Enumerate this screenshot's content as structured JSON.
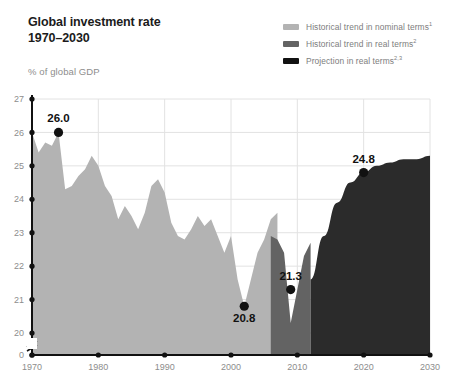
{
  "header": {
    "title_line1": "Global investment rate",
    "title_line2": "1970–2030",
    "subtitle": "% of global GDP"
  },
  "legend": {
    "position": "top-right",
    "items": [
      {
        "label": "Historical trend in nominal terms",
        "sup": "1",
        "color": "#b3b3b3",
        "swatch_name": "legend-swatch-nominal"
      },
      {
        "label": "Historical trend in real terms",
        "sup": "2",
        "color": "#636363",
        "swatch_name": "legend-swatch-real"
      },
      {
        "label": "Projection in real terms",
        "sup": "2,3",
        "color": "#111111",
        "swatch_name": "legend-swatch-projection"
      }
    ]
  },
  "colors": {
    "nominal": "#b3b3b3",
    "real": "#636363",
    "projection": "#2b2b2b",
    "axis": "#111111",
    "grid": "#e2e2e2",
    "tick_text": "#8d8d8d",
    "label_text": "#111111"
  },
  "chart_data": {
    "type": "area",
    "title": "Global investment rate 1970–2030",
    "subtitle": "% of global GDP",
    "xlabel": "",
    "ylabel": "% of global GDP",
    "xlim": [
      1970,
      2030
    ],
    "ylim": [
      20,
      27
    ],
    "y_axis_break": true,
    "y_break_from": 0,
    "y_break_to": 20,
    "grid": "vertical-and-horizontal-light",
    "x_ticks": [
      1970,
      1980,
      1990,
      2000,
      2010,
      2020,
      2030
    ],
    "y_ticks": [
      0,
      20,
      21,
      22,
      23,
      24,
      25,
      26,
      27
    ],
    "annotations": [
      {
        "text": "26.0",
        "x": 1974,
        "y": 26.0,
        "placement": "above"
      },
      {
        "text": "20.8",
        "x": 2002,
        "y": 20.8,
        "placement": "below"
      },
      {
        "text": "21.3",
        "x": 2009,
        "y": 21.3,
        "placement": "above"
      },
      {
        "text": "24.8",
        "x": 2020,
        "y": 24.8,
        "placement": "above"
      }
    ],
    "series": [
      {
        "name": "Historical trend in nominal terms",
        "color": "#b3b3b3",
        "x": [
          1970,
          1971,
          1972,
          1973,
          1974,
          1975,
          1976,
          1977,
          1978,
          1979,
          1980,
          1981,
          1982,
          1983,
          1984,
          1985,
          1986,
          1987,
          1988,
          1989,
          1990,
          1991,
          1992,
          1993,
          1994,
          1995,
          1996,
          1997,
          1998,
          1999,
          2000,
          2001,
          2002,
          2003,
          2004,
          2005,
          2006,
          2007
        ],
        "values": [
          26.0,
          25.4,
          25.7,
          25.6,
          26.0,
          24.3,
          24.4,
          24.7,
          24.9,
          25.3,
          25.0,
          24.4,
          24.1,
          23.4,
          23.8,
          23.5,
          23.1,
          23.6,
          24.4,
          24.6,
          24.2,
          23.3,
          22.9,
          22.8,
          23.1,
          23.5,
          23.2,
          23.4,
          22.9,
          22.4,
          22.9,
          21.6,
          20.8,
          21.6,
          22.4,
          22.8,
          23.4,
          23.6
        ]
      },
      {
        "name": "Historical trend in real terms",
        "color": "#636363",
        "x": [
          2006,
          2007,
          2008,
          2009,
          2010,
          2011,
          2012
        ],
        "values": [
          22.9,
          22.8,
          22.4,
          20.3,
          21.3,
          22.3,
          22.7
        ]
      },
      {
        "name": "Projection in real terms",
        "color": "#2b2b2b",
        "x": [
          2012,
          2014,
          2016,
          2018,
          2020,
          2022,
          2024,
          2026,
          2028,
          2030
        ],
        "values": [
          21.6,
          22.9,
          23.9,
          24.5,
          24.8,
          25.0,
          25.1,
          25.2,
          25.2,
          25.3
        ]
      }
    ]
  }
}
